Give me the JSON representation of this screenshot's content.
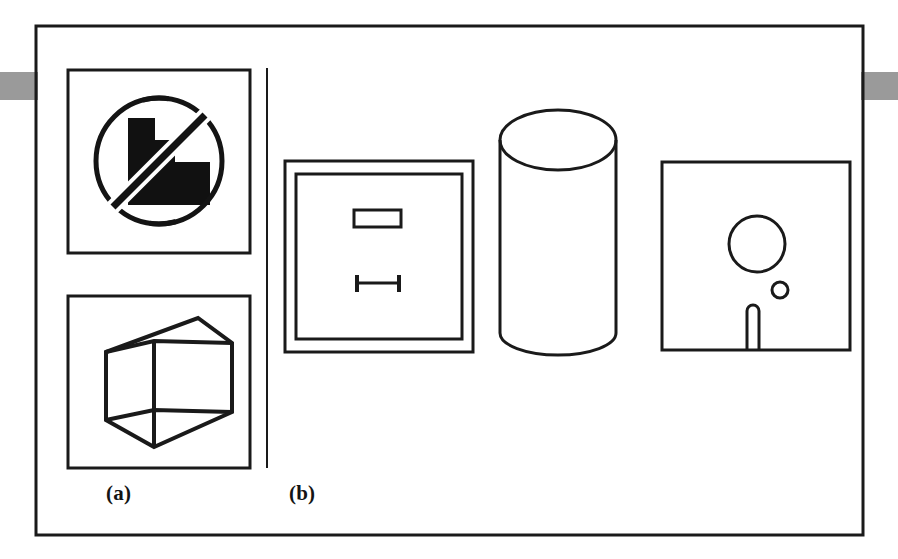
{
  "figure": {
    "kind": "engineering-drawing-plate",
    "width": 898,
    "height": 559,
    "background_color": "#ffffff",
    "ink_color": "#1a1a1a",
    "tab_color": "#9a9a9a",
    "outer_frame": {
      "x": 36,
      "y": 26,
      "width": 827,
      "height": 509,
      "stroke_width": 3
    },
    "divider": {
      "x": 267,
      "y1": 68,
      "y2": 468,
      "stroke_width": 2
    },
    "edge_tabs": [
      {
        "name": "left-edge-tab",
        "x": 0,
        "y": 72,
        "width": 38,
        "height": 28
      },
      {
        "name": "right-edge-tab",
        "x": 861,
        "y": 72,
        "width": 37,
        "height": 28
      }
    ]
  },
  "captions": [
    {
      "id": "a",
      "text": "(a)"
    },
    {
      "id": "b",
      "text": "(b)"
    }
  ],
  "panels": [
    {
      "id": "a",
      "caption": "(a)",
      "items": [
        {
          "name": "prohibited-stepped-shape-panel",
          "frame": {
            "x": 68,
            "y": 70,
            "width": 182,
            "height": 183,
            "stroke_width": 3
          },
          "glyph": "no-symbol-over-stepped-block",
          "circle": {
            "cx": 159,
            "cy": 161,
            "r": 63,
            "stroke_width": 5
          },
          "slash": {
            "x1": 115,
            "y1": 205,
            "x2": 203,
            "y2": 117,
            "stroke_width": 7
          },
          "stepped_block_fill": "#111111",
          "stepped_block_points": "128,118 155,118 155,140 175,140 175,162 210,162 210,205 128,205"
        },
        {
          "name": "isometric-box-panel",
          "frame": {
            "x": 68,
            "y": 296,
            "width": 182,
            "height": 172,
            "stroke_width": 3
          },
          "glyph": "isometric-rectangular-prism",
          "stroke_width": 4,
          "vertices": {
            "top_back": "198,318",
            "top_right": "232,343",
            "front_top_left": "106,352",
            "front_top_mid": "154,341",
            "mid_right": "232,343",
            "front_bottom_left": "106,420",
            "bottom_mid": "154,447",
            "bottom_right": "232,412"
          }
        }
      ]
    },
    {
      "id": "b",
      "caption": "(b)",
      "items": [
        {
          "name": "double-framed-square-with-rectangle-and-ibeam",
          "outer_frame": {
            "x": 285,
            "y": 161,
            "width": 188,
            "height": 191,
            "stroke_width": 3
          },
          "inner_frame": {
            "x": 296,
            "y": 174,
            "width": 166,
            "height": 165,
            "stroke_width": 3
          },
          "rectangle_slot": {
            "x": 354,
            "y": 210,
            "width": 47,
            "height": 17,
            "stroke_width": 3
          },
          "ibeam": {
            "bar_x1": 356,
            "bar_x2": 400,
            "bar_y": 283,
            "bar_stroke": 3,
            "cap_height": 17,
            "cap_stroke": 3
          }
        },
        {
          "name": "cylinder",
          "glyph": "cylinder-3d",
          "stroke_width": 3,
          "left_x": 500,
          "right_x": 616,
          "top_ellipse_cy": 140,
          "ellipse_ry": 30,
          "body_bottom_y": 355,
          "bottom_arc_ry": 22
        },
        {
          "name": "square-with-circles-and-slot",
          "frame": {
            "x": 662,
            "y": 162,
            "width": 188,
            "height": 188,
            "stroke_width": 3
          },
          "large_circle": {
            "cx": 757,
            "cy": 244,
            "r": 28,
            "stroke_width": 3
          },
          "small_circle": {
            "cx": 780,
            "cy": 290,
            "r": 8,
            "stroke_width": 3
          },
          "slot": {
            "cx": 753,
            "top_y": 305,
            "bottom_y": 350,
            "width": 12,
            "stroke_width": 3
          }
        }
      ]
    }
  ]
}
